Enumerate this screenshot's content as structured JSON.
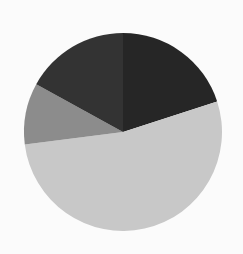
{
  "chart_data": {
    "type": "pie",
    "title": "",
    "labels": [
      "Slice A",
      "Slice B",
      "Slice C",
      "Slice D"
    ],
    "values": [
      20,
      53,
      10,
      17
    ],
    "colors": [
      "#262626",
      "#c8c8c8",
      "#8c8c8c",
      "#333333"
    ],
    "start_angle_deg": 0,
    "direction": "clockwise",
    "legend": "none",
    "center": [
      123,
      132
    ],
    "radius": 99
  }
}
